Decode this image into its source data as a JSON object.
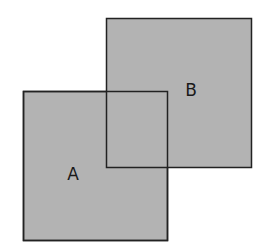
{
  "diagram": {
    "type": "overlapping-squares",
    "fill_color": "#b3b3b3",
    "stroke_color": "#222222",
    "shapes": [
      {
        "id": "A",
        "label": "A",
        "x": 23,
        "y": 91,
        "width": 144,
        "height": 149,
        "label_x": 73,
        "label_y": 180
      },
      {
        "id": "B",
        "label": "B",
        "x": 106,
        "y": 18,
        "width": 145,
        "height": 149,
        "label_x": 191,
        "label_y": 96
      }
    ]
  }
}
